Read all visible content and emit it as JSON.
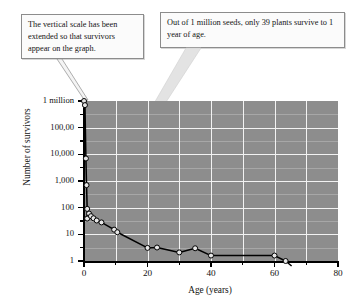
{
  "callouts": {
    "left": "The vertical scale has been extended so that survivors appear on the graph.",
    "right": "Out of 1 million seeds, only 39 plants survive to 1 year of age."
  },
  "chart_data": {
    "type": "line",
    "title": "",
    "xlabel": "Age (years)",
    "ylabel": "Number of survivors",
    "xlim": [
      0,
      80
    ],
    "ylim": [
      1,
      1000000
    ],
    "yscale": "log",
    "grid": true,
    "legend": "none",
    "xticks": [
      0,
      20,
      40,
      60,
      80
    ],
    "xticklabels": [
      "0",
      "20",
      "40",
      "60",
      "80"
    ],
    "yticks": [
      1,
      10,
      100,
      1000,
      10000,
      100000,
      1000000
    ],
    "yticklabels": [
      "1",
      "10",
      "100",
      "1,000",
      "10,000",
      "100,00",
      "1 million"
    ],
    "series": [
      {
        "name": "survivors",
        "marker": "open-circle",
        "color": "#000000",
        "points": [
          {
            "x": 0.0,
            "y": 1000000
          },
          {
            "x": 0.3,
            "y": 700000
          },
          {
            "x": 0.6,
            "y": 7000
          },
          {
            "x": 0.8,
            "y": 700
          },
          {
            "x": 1.0,
            "y": 90
          },
          {
            "x": 1.0,
            "y": 39
          },
          {
            "x": 1.6,
            "y": 60
          },
          {
            "x": 2.2,
            "y": 48
          },
          {
            "x": 3.0,
            "y": 40
          },
          {
            "x": 4.0,
            "y": 33
          },
          {
            "x": 5.5,
            "y": 28
          },
          {
            "x": 9.5,
            "y": 15
          },
          {
            "x": 10.5,
            "y": 12
          },
          {
            "x": 20.0,
            "y": 3.1
          },
          {
            "x": 23.0,
            "y": 3.2
          },
          {
            "x": 30.0,
            "y": 2.1
          },
          {
            "x": 35.0,
            "y": 3.0
          },
          {
            "x": 40.0,
            "y": 1.6
          },
          {
            "x": 60.0,
            "y": 1.6
          },
          {
            "x": 63.5,
            "y": 1.0
          }
        ]
      }
    ],
    "annotations": [
      {
        "text": "The vertical scale has been extended so that survivors appear on the graph.",
        "points_to": "first-data-point"
      },
      {
        "text": "Out of 1 million seeds, only 39 plants survive to 1 year of age.",
        "points_to": "age-1-survivors"
      }
    ]
  },
  "colors": {
    "plot_background": "#8d8d8d",
    "gridline": "#f2f2f2",
    "axis": "#000000",
    "callout_border": "#8c8c8c",
    "callout_fill": "#fbfbfb",
    "pointer": "#d8d8d8"
  }
}
